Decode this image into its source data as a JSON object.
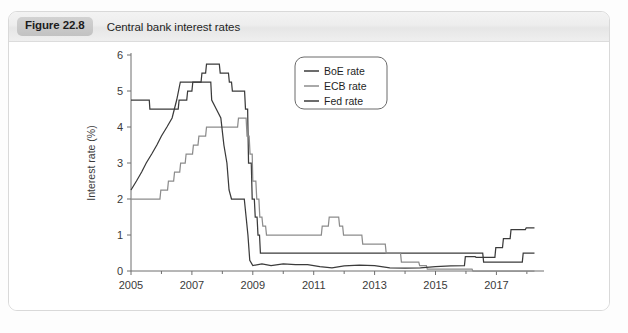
{
  "figure": {
    "badge": "Figure 22.8",
    "caption": "Central bank interest rates"
  },
  "chart_data": {
    "type": "line",
    "title": "Central bank interest rates",
    "xlabel": "",
    "ylabel": "Interest rate (%)",
    "xlim": [
      2005.0,
      2018.3
    ],
    "ylim": [
      0,
      6
    ],
    "yticks": [
      0,
      1,
      2,
      3,
      4,
      5,
      6
    ],
    "ytick_labels": [
      "0",
      "1",
      "2",
      "3",
      "4",
      "5",
      "6"
    ],
    "xticks": [
      2005,
      2007,
      2009,
      2011,
      2013,
      2015,
      2017
    ],
    "xtick_labels": [
      "2005",
      "2007",
      "2009",
      "2011",
      "2013",
      "2015",
      "2017"
    ],
    "x_minor_ticks": [
      2006,
      2008,
      2010,
      2012,
      2014,
      2016,
      2018
    ],
    "grid": false,
    "legend_position": "upper-center-right",
    "series": [
      {
        "name": "BoE rate",
        "color": "#3b3b3b",
        "width": 1.25,
        "points": [
          [
            2005.0,
            4.75
          ],
          [
            2005.6,
            4.75
          ],
          [
            2005.62,
            4.5
          ],
          [
            2006.55,
            4.5
          ],
          [
            2006.58,
            4.75
          ],
          [
            2006.83,
            4.75
          ],
          [
            2006.86,
            5.0
          ],
          [
            2007.0,
            5.0
          ],
          [
            2007.03,
            5.25
          ],
          [
            2007.3,
            5.25
          ],
          [
            2007.33,
            5.5
          ],
          [
            2007.45,
            5.5
          ],
          [
            2007.48,
            5.75
          ],
          [
            2007.9,
            5.75
          ],
          [
            2007.93,
            5.5
          ],
          [
            2008.2,
            5.5
          ],
          [
            2008.23,
            5.25
          ],
          [
            2008.3,
            5.25
          ],
          [
            2008.33,
            5.0
          ],
          [
            2008.73,
            5.0
          ],
          [
            2008.76,
            4.5
          ],
          [
            2008.83,
            4.5
          ],
          [
            2008.86,
            3.0
          ],
          [
            2008.95,
            3.0
          ],
          [
            2008.98,
            2.0
          ],
          [
            2009.05,
            2.0
          ],
          [
            2009.08,
            1.5
          ],
          [
            2009.14,
            1.5
          ],
          [
            2009.17,
            1.0
          ],
          [
            2009.22,
            1.0
          ],
          [
            2009.25,
            0.5
          ],
          [
            2016.55,
            0.5
          ],
          [
            2016.58,
            0.25
          ],
          [
            2017.85,
            0.25
          ],
          [
            2017.88,
            0.5
          ],
          [
            2018.25,
            0.5
          ]
        ]
      },
      {
        "name": "ECB rate",
        "color": "#8c8c8c",
        "width": 1.25,
        "points": [
          [
            2005.0,
            2.0
          ],
          [
            2005.95,
            2.0
          ],
          [
            2005.98,
            2.25
          ],
          [
            2006.2,
            2.25
          ],
          [
            2006.23,
            2.5
          ],
          [
            2006.4,
            2.5
          ],
          [
            2006.43,
            2.75
          ],
          [
            2006.6,
            2.75
          ],
          [
            2006.63,
            3.0
          ],
          [
            2006.78,
            3.0
          ],
          [
            2006.81,
            3.25
          ],
          [
            2007.02,
            3.25
          ],
          [
            2007.05,
            3.5
          ],
          [
            2007.2,
            3.5
          ],
          [
            2007.23,
            3.75
          ],
          [
            2007.45,
            3.75
          ],
          [
            2007.48,
            4.0
          ],
          [
            2008.5,
            4.0
          ],
          [
            2008.53,
            4.25
          ],
          [
            2008.78,
            4.25
          ],
          [
            2008.81,
            3.75
          ],
          [
            2008.88,
            3.75
          ],
          [
            2008.91,
            3.25
          ],
          [
            2008.98,
            3.25
          ],
          [
            2009.0,
            2.5
          ],
          [
            2009.1,
            2.5
          ],
          [
            2009.13,
            2.0
          ],
          [
            2009.2,
            2.0
          ],
          [
            2009.23,
            1.5
          ],
          [
            2009.3,
            1.5
          ],
          [
            2009.33,
            1.25
          ],
          [
            2009.42,
            1.25
          ],
          [
            2009.45,
            1.0
          ],
          [
            2011.25,
            1.0
          ],
          [
            2011.28,
            1.25
          ],
          [
            2011.48,
            1.25
          ],
          [
            2011.51,
            1.5
          ],
          [
            2011.82,
            1.5
          ],
          [
            2011.85,
            1.25
          ],
          [
            2011.95,
            1.25
          ],
          [
            2011.98,
            1.0
          ],
          [
            2012.58,
            1.0
          ],
          [
            2012.61,
            0.75
          ],
          [
            2013.35,
            0.75
          ],
          [
            2013.38,
            0.5
          ],
          [
            2013.85,
            0.5
          ],
          [
            2013.88,
            0.25
          ],
          [
            2014.45,
            0.25
          ],
          [
            2014.48,
            0.15
          ],
          [
            2014.7,
            0.15
          ],
          [
            2014.73,
            0.05
          ],
          [
            2016.2,
            0.05
          ],
          [
            2016.23,
            0.0
          ],
          [
            2018.25,
            0.0
          ]
        ]
      },
      {
        "name": "Fed rate",
        "color": "#3b3b3b",
        "width": 1.25,
        "points": [
          [
            2005.0,
            2.25
          ],
          [
            2005.18,
            2.5
          ],
          [
            2005.35,
            2.75
          ],
          [
            2005.5,
            3.0
          ],
          [
            2005.68,
            3.25
          ],
          [
            2005.85,
            3.5
          ],
          [
            2006.0,
            3.75
          ],
          [
            2006.18,
            4.0
          ],
          [
            2006.35,
            4.25
          ],
          [
            2006.5,
            4.75
          ],
          [
            2006.62,
            5.25
          ],
          [
            2007.62,
            5.25
          ],
          [
            2007.65,
            4.75
          ],
          [
            2007.8,
            4.5
          ],
          [
            2007.95,
            4.25
          ],
          [
            2008.05,
            3.5
          ],
          [
            2008.15,
            3.0
          ],
          [
            2008.22,
            2.25
          ],
          [
            2008.3,
            2.0
          ],
          [
            2008.72,
            2.0
          ],
          [
            2008.78,
            1.5
          ],
          [
            2008.84,
            1.0
          ],
          [
            2008.9,
            0.3
          ],
          [
            2009.0,
            0.15
          ],
          [
            2009.3,
            0.2
          ],
          [
            2009.6,
            0.15
          ],
          [
            2010.0,
            0.2
          ],
          [
            2010.4,
            0.18
          ],
          [
            2010.8,
            0.18
          ],
          [
            2011.2,
            0.12
          ],
          [
            2011.6,
            0.09
          ],
          [
            2012.0,
            0.14
          ],
          [
            2012.5,
            0.16
          ],
          [
            2013.0,
            0.15
          ],
          [
            2013.5,
            0.09
          ],
          [
            2014.0,
            0.08
          ],
          [
            2014.5,
            0.09
          ],
          [
            2015.0,
            0.12
          ],
          [
            2015.5,
            0.14
          ],
          [
            2015.95,
            0.15
          ],
          [
            2015.98,
            0.4
          ],
          [
            2016.3,
            0.4
          ],
          [
            2016.33,
            0.38
          ],
          [
            2016.95,
            0.38
          ],
          [
            2016.98,
            0.65
          ],
          [
            2017.2,
            0.65
          ],
          [
            2017.23,
            0.9
          ],
          [
            2017.45,
            0.9
          ],
          [
            2017.48,
            1.15
          ],
          [
            2017.95,
            1.15
          ],
          [
            2017.98,
            1.2
          ],
          [
            2018.25,
            1.2
          ]
        ]
      }
    ],
    "legend": [
      {
        "label": "BoE rate",
        "color": "#3b3b3b"
      },
      {
        "label": "ECB rate",
        "color": "#8c8c8c"
      },
      {
        "label": "Fed rate",
        "color": "#3b3b3b"
      }
    ]
  }
}
